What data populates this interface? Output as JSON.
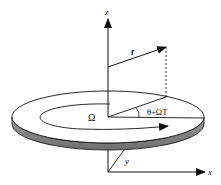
{
  "diagram": {
    "labels": {
      "z_axis": "z",
      "x_axis": "x",
      "y_axis": "y",
      "position_vector": "r",
      "angular_velocity": "Ω",
      "angle": "θ+ΩT"
    },
    "colors": {
      "line": "#111111",
      "disk_top": "#ffffff",
      "disk_side": "#8a8a8a",
      "background": "#ffffff"
    }
  }
}
